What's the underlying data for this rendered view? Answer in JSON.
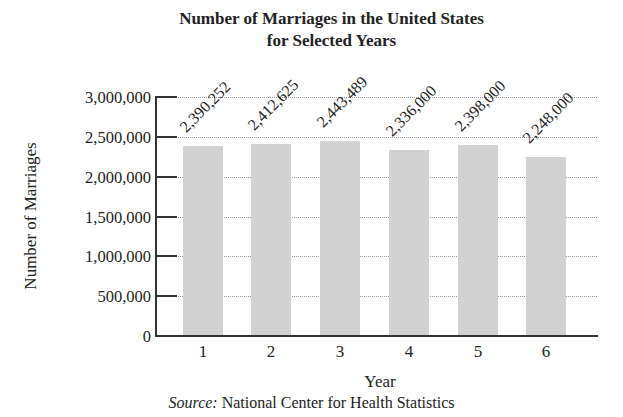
{
  "chart_data": {
    "type": "bar",
    "title": "Number of Marriages in the United States for Selected Years",
    "title_lines": [
      "Number of Marriages in the United States",
      "for Selected Years"
    ],
    "xlabel": "Year",
    "ylabel": "Number of Marriages",
    "categories": [
      "1",
      "2",
      "3",
      "4",
      "5",
      "6"
    ],
    "values": [
      2390252,
      2412625,
      2443489,
      2336000,
      2398000,
      2248000
    ],
    "value_labels": [
      "2,390,252",
      "2,412,625",
      "2,443,489",
      "2,336,000",
      "2,398,000",
      "2,248,000"
    ],
    "ylim": [
      0,
      3000000
    ],
    "yticks": [
      0,
      500000,
      1000000,
      1500000,
      2000000,
      2500000,
      3000000
    ],
    "ytick_labels": [
      "0",
      "500,000",
      "1,000,000",
      "1,500,000",
      "2,000,000",
      "2,500,000",
      "3,000,000"
    ],
    "grid": true,
    "legend": null,
    "bar_color": "#d2d2d2",
    "source_prefix": "Source:",
    "source_text": "National Center for Health Statistics"
  }
}
